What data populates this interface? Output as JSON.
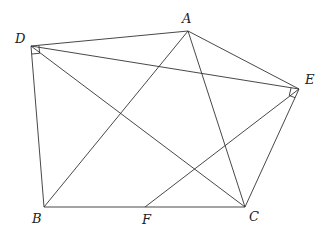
{
  "diagram": {
    "type": "geometry",
    "stroke_color": "#333333",
    "points": {
      "A": {
        "label": "A",
        "x": 188,
        "y": 31
      },
      "B": {
        "label": "B",
        "x": 44,
        "y": 207
      },
      "C": {
        "label": "C",
        "x": 245,
        "y": 207
      },
      "D": {
        "label": "D",
        "x": 31,
        "y": 46
      },
      "E": {
        "label": "E",
        "x": 299,
        "y": 89
      },
      "F": {
        "label": "F",
        "x": 145,
        "y": 207
      }
    },
    "segments": [
      "DA",
      "AE",
      "DE",
      "DB",
      "DC",
      "AB",
      "AC",
      "EF",
      "EC",
      "BC"
    ],
    "right_angles": [
      "D",
      "E"
    ]
  }
}
